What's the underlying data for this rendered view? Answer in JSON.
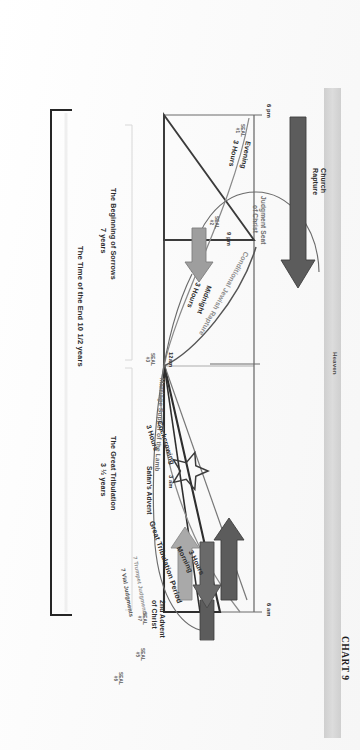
{
  "chart": {
    "heading": "CHART 9",
    "type": "diagram",
    "kind": "prophecy-timeline"
  },
  "bands": {
    "heaven_label": "Heaven"
  },
  "time_markers": [
    {
      "id": "t-6pm",
      "label": "6 pm"
    },
    {
      "id": "t-9pm",
      "label": "9 pm"
    },
    {
      "id": "t-12am",
      "label": "12am"
    },
    {
      "id": "t-3am",
      "label": "3 am"
    },
    {
      "id": "t-6am",
      "label": "6 am"
    }
  ],
  "watch_periods": [
    {
      "id": "w-evening",
      "name": "Evening",
      "duration": "3 Hours"
    },
    {
      "id": "w-midnight",
      "name": "Midnight",
      "duration": "3 Hours"
    },
    {
      "id": "w-cockcrowing",
      "name": "Cockcrowing",
      "duration": "3 Hours"
    },
    {
      "id": "w-morning",
      "name": "Morning",
      "duration": "3 Hours"
    }
  ],
  "events": {
    "church_rapture": "Church\nRapture",
    "church_rapture_line1": "Church",
    "church_rapture_line2": "Rapture",
    "conditional_jewish_rapture": "Conditional Jewish Rapture",
    "judgment_seat_line1": "Judgment Seat",
    "judgment_seat_line2": "of Christ",
    "marriage_supper": "Marriage Supper of the Lamb",
    "satans_advent": "Satan's Advent",
    "great_tribulation_period": "Great Tribulation Period",
    "second_advent_line1": "2nd Advent",
    "second_advent_line2": "of Christ",
    "trumpet_judgments": "7 Trumpet Judgments",
    "vial_judgments": "7 Vial Judgments"
  },
  "brackets": [
    {
      "id": "bracket-sorrows",
      "line1": "The Beginning of Sorrows",
      "line2": "7 years"
    },
    {
      "id": "bracket-tribulation",
      "line1": "The Great Tribulation",
      "line2": "3 ½ years"
    },
    {
      "id": "bracket-time-of-end",
      "line1": "The Time of the End  10 1/2 years"
    }
  ],
  "seals": [
    {
      "id": "seal-1",
      "line1": "SEAL",
      "line2": "#1"
    },
    {
      "id": "seal-2",
      "line1": "SEAL",
      "line2": "#2"
    },
    {
      "id": "seal-3",
      "line1": "SEAL",
      "line2": "#3"
    },
    {
      "id": "seal-4",
      "line1": "SEAL",
      "line2": "#4"
    },
    {
      "id": "seal-5",
      "line1": "SEAL",
      "line2": "#5"
    },
    {
      "id": "seal-6",
      "line1": "SEAL",
      "line2": "#6"
    },
    {
      "id": "seal-7",
      "line1": "SEAL",
      "line2": "#7"
    }
  ],
  "colors": {
    "ink": "#2b2b2b",
    "arrow_dark": "#585858",
    "arrow_light": "#a8a8a8",
    "heaven_band": "#d4d4d4",
    "line": "#3a3a3a",
    "thin_line": "#777777",
    "page": "#fefefe"
  }
}
